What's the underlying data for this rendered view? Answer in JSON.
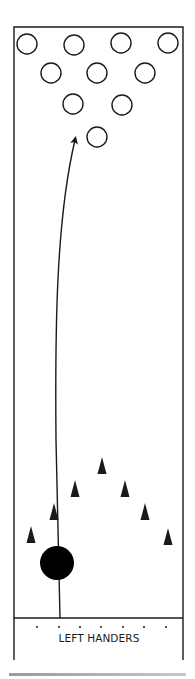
{
  "diagram": {
    "label": "LEFT HANDERS",
    "colors": {
      "stroke": "#1a1a1a",
      "background": "#ffffff",
      "ball": "#000000"
    },
    "lane": {
      "x": 14,
      "y": 27,
      "width": 169,
      "foul_line_y": 618,
      "bottom_y": 660
    },
    "pins": [
      {
        "id": 7,
        "cx": 27,
        "cy": 44
      },
      {
        "id": 8,
        "cx": 74,
        "cy": 45
      },
      {
        "id": 9,
        "cx": 121,
        "cy": 43
      },
      {
        "id": 10,
        "cx": 168,
        "cy": 43
      },
      {
        "id": 4,
        "cx": 51,
        "cy": 73
      },
      {
        "id": 5,
        "cx": 97,
        "cy": 73
      },
      {
        "id": 6,
        "cx": 145,
        "cy": 73
      },
      {
        "id": 2,
        "cx": 73,
        "cy": 104
      },
      {
        "id": 3,
        "cx": 122,
        "cy": 105
      },
      {
        "id": 1,
        "cx": 97,
        "cy": 137
      }
    ],
    "pin_radius": 10,
    "target_arrows": [
      {
        "cx": 31,
        "cy": 535
      },
      {
        "cx": 54,
        "cy": 512
      },
      {
        "cx": 75,
        "cy": 489
      },
      {
        "cx": 102,
        "cy": 466
      },
      {
        "cx": 125,
        "cy": 489
      },
      {
        "cx": 145,
        "cy": 512
      },
      {
        "cx": 168,
        "cy": 537
      }
    ],
    "ball": {
      "cx": 57,
      "cy": 563,
      "r": 17
    },
    "dots_y": 627,
    "dots_x": [
      37,
      59,
      80,
      101,
      123,
      144,
      166
    ],
    "path": "M 60 618 L 56 440 C 55 330, 56 220, 75 140"
  }
}
